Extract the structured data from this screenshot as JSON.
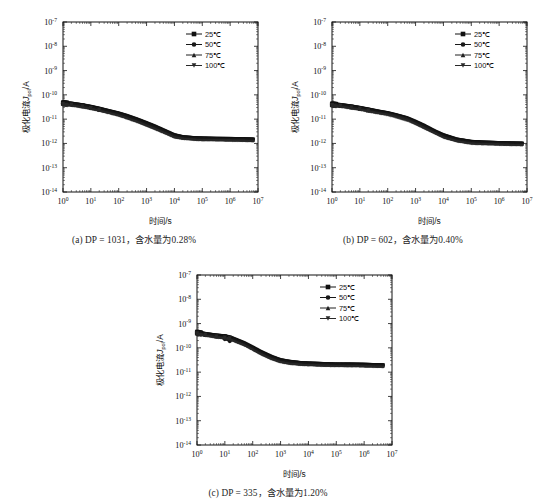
{
  "figure": {
    "panels": [
      {
        "id": "a",
        "caption": "(a) DP = 1031，含水量为0.28%",
        "xlabel": "时间/s",
        "ylabel": "极化电流Jpol/A",
        "ylabel_main": "极化电流",
        "ylabel_italic": "J",
        "ylabel_sub": "pol",
        "ylabel_tail": "/A",
        "legend": [
          "25℃",
          "50℃",
          "75℃",
          "100℃"
        ]
      },
      {
        "id": "b",
        "caption": "(b) DP = 602，含水量为0.40%",
        "xlabel": "时间/s",
        "ylabel": "极化电流Jpol/A",
        "ylabel_main": "极化电流",
        "ylabel_italic": "J",
        "ylabel_sub": "pol",
        "ylabel_tail": "/A",
        "legend": [
          "25℃",
          "50℃",
          "75℃",
          "100℃"
        ]
      },
      {
        "id": "c",
        "caption": "(c) DP = 335，含水量为1.20%",
        "xlabel": "时间/s",
        "ylabel": "极化电流Jpol/A",
        "ylabel_main": "极化电流",
        "ylabel_italic": "J",
        "ylabel_sub": "pol",
        "ylabel_tail": "/A",
        "legend": [
          "25℃",
          "50℃",
          "75℃",
          "100℃"
        ]
      }
    ]
  },
  "chart_data": [
    {
      "type": "scatter",
      "panel": "a",
      "title": "(a) DP = 1031，含水量为0.28%",
      "xlabel": "时间/s",
      "ylabel": "极化电流Jpol/A",
      "xscale": "log",
      "yscale": "log",
      "xlim": [
        1,
        10000000
      ],
      "ylim": [
        1e-14,
        1e-07
      ],
      "xticks": [
        1,
        10,
        100,
        1000,
        10000,
        100000,
        1000000,
        10000000
      ],
      "xticklabels": [
        "10^0",
        "10^1",
        "10^2",
        "10^3",
        "10^4",
        "10^5",
        "10^6",
        "10^7"
      ],
      "yticks": [
        1e-14,
        1e-13,
        1e-12,
        1e-11,
        1e-10,
        1e-09,
        1e-08,
        1e-07
      ],
      "yticklabels": [
        "10^-14",
        "10^-13",
        "10^-12",
        "10^-11",
        "10^-10",
        "10^-9",
        "10^-8",
        "10^-7"
      ],
      "grid": false,
      "legend_position": "upper right",
      "series": [
        {
          "name": "25℃",
          "marker": "square",
          "color": "#101010",
          "x": [
            1,
            2,
            5,
            10,
            20,
            50,
            100,
            200,
            500,
            1000,
            2000,
            5000,
            10000,
            20000,
            50000,
            100000,
            300000,
            1000000,
            3000000,
            7000000
          ],
          "y": [
            4.5e-11,
            4.2e-11,
            3.6e-11,
            3.1e-11,
            2.6e-11,
            2e-11,
            1.65e-11,
            1.3e-11,
            9e-12,
            6.6e-12,
            4.8e-12,
            3e-12,
            2.1e-12,
            1.75e-12,
            1.6e-12,
            1.55e-12,
            1.5e-12,
            1.48e-12,
            1.45e-12,
            1.4e-12
          ]
        },
        {
          "name": "50℃",
          "marker": "circle",
          "color": "#181818",
          "x": [
            1,
            2,
            5,
            10,
            20,
            50,
            100,
            200,
            500,
            1000,
            2000,
            5000,
            10000,
            20000,
            50000,
            100000,
            300000,
            1000000,
            3000000,
            7000000
          ],
          "y": [
            4.4e-11,
            4.1e-11,
            3.5e-11,
            3e-11,
            2.5e-11,
            1.95e-11,
            1.6e-11,
            1.25e-11,
            8.6e-12,
            6.3e-12,
            4.6e-12,
            2.9e-12,
            2e-12,
            1.72e-12,
            1.58e-12,
            1.53e-12,
            1.49e-12,
            1.46e-12,
            1.43e-12,
            1.38e-12
          ]
        },
        {
          "name": "75℃",
          "marker": "triangle-up",
          "color": "#202020",
          "x": [
            1,
            2,
            5,
            10,
            20,
            50,
            100,
            200,
            500,
            1000,
            2000,
            5000,
            10000,
            20000,
            50000,
            100000,
            300000,
            1000000,
            3000000,
            7000000
          ],
          "y": [
            4.3e-11,
            4e-11,
            3.4e-11,
            2.9e-11,
            2.45e-11,
            1.9e-11,
            1.55e-11,
            1.2e-11,
            8.3e-12,
            6e-12,
            4.4e-12,
            2.8e-12,
            1.95e-12,
            1.7e-12,
            1.56e-12,
            1.5e-12,
            1.47e-12,
            1.44e-12,
            1.41e-12,
            1.36e-12
          ]
        },
        {
          "name": "100℃",
          "marker": "triangle-down",
          "color": "#282828",
          "x": [
            1,
            2,
            5,
            10,
            20,
            50,
            100,
            200,
            500,
            1000,
            2000,
            5000,
            10000,
            20000,
            50000,
            100000,
            300000,
            1000000,
            3000000,
            7000000
          ],
          "y": [
            4.2e-11,
            3.9e-11,
            3.3e-11,
            2.85e-11,
            2.4e-11,
            1.85e-11,
            1.5e-11,
            1.15e-11,
            8e-12,
            5.8e-12,
            4.2e-12,
            2.7e-12,
            1.9e-12,
            1.68e-12,
            1.54e-12,
            1.48e-12,
            1.45e-12,
            1.42e-12,
            1.39e-12,
            1.34e-12
          ]
        }
      ]
    },
    {
      "type": "scatter",
      "panel": "b",
      "title": "(b) DP = 602，含水量为0.40%",
      "xlabel": "时间/s",
      "ylabel": "极化电流Jpol/A",
      "xscale": "log",
      "yscale": "log",
      "xlim": [
        1,
        10000000
      ],
      "ylim": [
        1e-14,
        1e-07
      ],
      "xticks": [
        1,
        10,
        100,
        1000,
        10000,
        100000,
        1000000,
        10000000
      ],
      "xticklabels": [
        "10^0",
        "10^1",
        "10^2",
        "10^3",
        "10^4",
        "10^5",
        "10^6",
        "10^7"
      ],
      "yticks": [
        1e-14,
        1e-13,
        1e-12,
        1e-11,
        1e-10,
        1e-09,
        1e-08,
        1e-07
      ],
      "yticklabels": [
        "10^-14",
        "10^-13",
        "10^-12",
        "10^-11",
        "10^-10",
        "10^-9",
        "10^-8",
        "10^-7"
      ],
      "grid": false,
      "legend_position": "upper right",
      "series": [
        {
          "name": "25℃",
          "marker": "square",
          "color": "#101010",
          "x": [
            1,
            2,
            5,
            10,
            20,
            50,
            100,
            200,
            500,
            1000,
            2000,
            5000,
            10000,
            30000,
            100000,
            300000,
            1000000,
            3000000,
            7000000
          ],
          "y": [
            4e-11,
            3.7e-11,
            3.2e-11,
            2.8e-11,
            2.4e-11,
            1.95e-11,
            1.7e-11,
            1.4e-11,
            1.05e-11,
            7.5e-12,
            5.2e-12,
            3e-12,
            2.1e-12,
            1.4e-12,
            1.12e-12,
            1.05e-12,
            1e-12,
            9.7e-13,
            9.5e-13
          ]
        },
        {
          "name": "50℃",
          "marker": "circle",
          "color": "#181818",
          "x": [
            1,
            2,
            5,
            10,
            20,
            50,
            100,
            200,
            500,
            1000,
            2000,
            5000,
            10000,
            30000,
            100000,
            300000,
            1000000,
            3000000,
            7000000
          ],
          "y": [
            3.9e-11,
            3.6e-11,
            3.1e-11,
            2.75e-11,
            2.35e-11,
            1.9e-11,
            1.65e-11,
            1.35e-11,
            1e-11,
            7.2e-12,
            5e-12,
            2.9e-12,
            2e-12,
            1.36e-12,
            1.1e-12,
            1.03e-12,
            9.9e-13,
            9.6e-13,
            9.4e-13
          ]
        },
        {
          "name": "75℃",
          "marker": "triangle-up",
          "color": "#202020",
          "x": [
            1,
            2,
            5,
            10,
            20,
            50,
            100,
            200,
            500,
            1000,
            2000,
            5000,
            10000,
            30000,
            100000,
            300000,
            1000000,
            3000000,
            7000000
          ],
          "y": [
            3.85e-11,
            3.55e-11,
            3.05e-11,
            2.7e-11,
            2.3e-11,
            1.88e-11,
            1.72e-11,
            1.45e-11,
            1.1e-11,
            7e-12,
            4.8e-12,
            2.85e-12,
            1.95e-12,
            1.34e-12,
            1.08e-12,
            1.02e-12,
            9.8e-13,
            9.5e-13,
            9.3e-13
          ]
        },
        {
          "name": "100℃",
          "marker": "triangle-down",
          "color": "#282828",
          "x": [
            1,
            2,
            5,
            10,
            20,
            50,
            100,
            200,
            500,
            1000,
            2000,
            5000,
            10000,
            30000,
            100000,
            300000,
            1000000,
            3000000,
            7000000
          ],
          "y": [
            3.8e-11,
            3.5e-11,
            3e-11,
            2.65e-11,
            2.25e-11,
            1.85e-11,
            1.6e-11,
            1.3e-11,
            9.5e-12,
            6.8e-12,
            4.6e-12,
            2.8e-12,
            1.9e-12,
            1.32e-12,
            1.06e-12,
            1e-12,
            9.7e-13,
            9.4e-13,
            9.2e-13
          ]
        }
      ]
    },
    {
      "type": "scatter",
      "panel": "c",
      "title": "(c) DP = 335，含水量为1.20%",
      "xlabel": "时间/s",
      "ylabel": "极化电流Jpol/A",
      "xscale": "log",
      "yscale": "log",
      "xlim": [
        1,
        10000000
      ],
      "ylim": [
        1e-14,
        1e-07
      ],
      "xticks": [
        1,
        10,
        100,
        1000,
        10000,
        100000,
        1000000,
        10000000
      ],
      "xticklabels": [
        "10^0",
        "10^1",
        "10^2",
        "10^3",
        "10^4",
        "10^5",
        "10^6",
        "10^7"
      ],
      "yticks": [
        1e-14,
        1e-13,
        1e-12,
        1e-11,
        1e-10,
        1e-09,
        1e-08,
        1e-07
      ],
      "yticklabels": [
        "10^-14",
        "10^-13",
        "10^-12",
        "10^-11",
        "10^-10",
        "10^-9",
        "10^-8",
        "10^-7"
      ],
      "grid": false,
      "legend_position": "upper right",
      "series": [
        {
          "name": "25℃",
          "marker": "square",
          "color": "#101010",
          "x": [
            1,
            2,
            5,
            10,
            15,
            20,
            50,
            100,
            200,
            500,
            1000,
            2000,
            5000,
            10000,
            30000,
            100000,
            300000,
            1000000,
            2000000,
            5000000
          ],
          "y": [
            4.2e-10,
            3.6e-10,
            3.1e-10,
            2.9e-10,
            2.6e-10,
            2.3e-10,
            1.5e-10,
            1e-10,
            6.5e-11,
            4e-11,
            3e-11,
            2.6e-11,
            2.3e-11,
            2.2e-11,
            2.1e-11,
            2e-11,
            2e-11,
            1.95e-11,
            1.9e-11,
            1.85e-11
          ]
        },
        {
          "name": "50℃",
          "marker": "circle",
          "color": "#181818",
          "x": [
            1,
            2,
            5,
            10,
            15,
            20,
            50,
            100,
            200,
            500,
            1000,
            2000,
            5000,
            10000,
            30000,
            100000,
            300000,
            1000000,
            2000000,
            5000000
          ],
          "y": [
            4.1e-10,
            3.5e-10,
            3e-10,
            2.3e-10,
            1.9e-10,
            2.2e-10,
            1.45e-10,
            9.5e-11,
            6.2e-11,
            3.8e-11,
            2.9e-11,
            2.5e-11,
            2.25e-11,
            2.15e-11,
            2.05e-11,
            1.98e-11,
            1.95e-11,
            1.9e-11,
            1.88e-11,
            1.82e-11
          ]
        },
        {
          "name": "75℃",
          "marker": "triangle-up",
          "color": "#202020",
          "x": [
            1,
            2,
            5,
            10,
            15,
            20,
            50,
            100,
            200,
            500,
            1000,
            2000,
            5000,
            10000,
            30000,
            100000,
            300000,
            1000000,
            2000000,
            5000000
          ],
          "y": [
            4e-10,
            3.45e-10,
            2.95e-10,
            2.7e-10,
            2.5e-10,
            2.15e-10,
            1.4e-10,
            9.2e-11,
            6e-11,
            3.7e-11,
            2.85e-11,
            2.45e-11,
            2.2e-11,
            2.12e-11,
            2.02e-11,
            1.96e-11,
            1.93e-11,
            1.88e-11,
            1.85e-11,
            1.8e-11
          ]
        },
        {
          "name": "100℃",
          "marker": "triangle-down",
          "color": "#282828",
          "x": [
            1,
            2,
            5,
            10,
            15,
            20,
            50,
            100,
            200,
            500,
            1000,
            2000,
            5000,
            10000,
            30000,
            100000,
            300000,
            1000000,
            2000000,
            5000000
          ],
          "y": [
            3.95e-10,
            3.4e-10,
            2.9e-10,
            2.65e-10,
            2.45e-10,
            2.1e-10,
            1.38e-10,
            9e-11,
            5.8e-11,
            3.6e-11,
            2.8e-11,
            2.4e-11,
            2.18e-11,
            2.1e-11,
            2e-11,
            1.94e-11,
            1.91e-11,
            1.86e-11,
            1.83e-11,
            1.78e-11
          ]
        }
      ]
    }
  ]
}
